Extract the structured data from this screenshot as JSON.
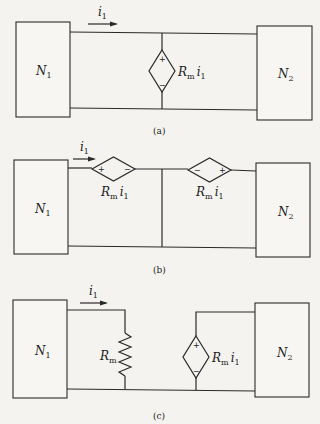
{
  "figures": [
    {
      "caption": "(a)",
      "current_label": "i",
      "current_sub": "1",
      "left_network": {
        "name": "N",
        "sub": "1"
      },
      "right_network": {
        "name": "N",
        "sub": "2"
      },
      "source": {
        "type": "dependent-voltage-source",
        "label": "R",
        "label_sub": "m",
        "label_tail": "i",
        "label_tail_sub": "1",
        "plus": "+",
        "minus": "−"
      }
    },
    {
      "caption": "(b)",
      "current_label": "i",
      "current_sub": "1",
      "left_network": {
        "name": "N",
        "sub": "1"
      },
      "right_network": {
        "name": "N",
        "sub": "2"
      },
      "sources": [
        {
          "type": "dependent-voltage-source",
          "label": "R",
          "label_sub": "m",
          "label_tail": "i",
          "label_tail_sub": "1",
          "left_sign": "+",
          "right_sign": "−"
        },
        {
          "type": "dependent-voltage-source",
          "label": "R",
          "label_sub": "m",
          "label_tail": "i",
          "label_tail_sub": "1",
          "left_sign": "−",
          "right_sign": "+"
        }
      ]
    },
    {
      "caption": "(c)",
      "current_label": "i",
      "current_sub": "1",
      "left_network": {
        "name": "N",
        "sub": "1"
      },
      "right_network": {
        "name": "N",
        "sub": "2"
      },
      "resistor": {
        "label": "R",
        "label_sub": "m"
      },
      "source": {
        "type": "dependent-voltage-source",
        "label": "R",
        "label_sub": "m",
        "label_tail": "i",
        "label_tail_sub": "1",
        "plus": "+",
        "minus": "−"
      }
    }
  ]
}
